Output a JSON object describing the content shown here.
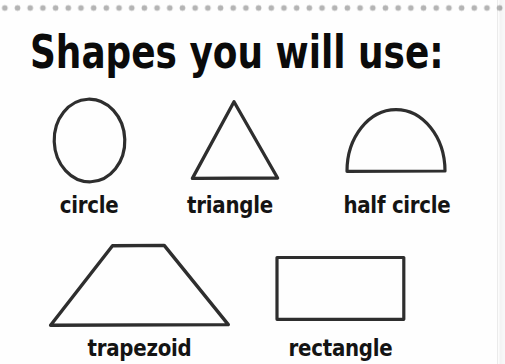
{
  "title": "Shapes you will use:",
  "shapes": [
    {
      "name": "circle",
      "label": "circle"
    },
    {
      "name": "triangle",
      "label": "triangle"
    },
    {
      "name": "half-circle",
      "label": "half circle"
    },
    {
      "name": "trapezoid",
      "label": "trapezoid"
    },
    {
      "name": "rectangle",
      "label": "rectangle"
    }
  ],
  "colors": {
    "shape_stroke": "#2e2e2e",
    "label_text": "#141414",
    "title_text": "#0b0b0b",
    "dots": "#b4b4b4",
    "background": "#fefefe"
  }
}
